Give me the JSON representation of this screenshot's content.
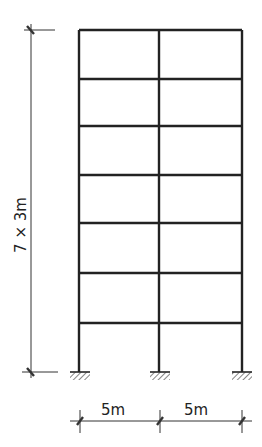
{
  "diagram": {
    "type": "multi-storey plane frame",
    "stories": 7,
    "bays": 2,
    "height_label": "7 × 3m",
    "span_labels": [
      "5m",
      "5m"
    ],
    "colors": {
      "line": "#222222",
      "background": "#ffffff"
    }
  }
}
